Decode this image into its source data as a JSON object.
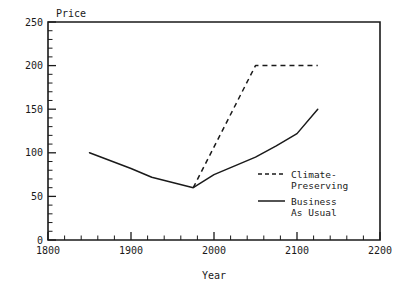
{
  "chart_data": {
    "type": "line",
    "title": "",
    "xlabel": "Year",
    "ylabel": "Price",
    "xlim": [
      1800,
      2200
    ],
    "ylim": [
      0,
      250
    ],
    "grid": false,
    "legend_position": "inside-right",
    "x_ticks": [
      1800,
      1900,
      2000,
      2100,
      2200
    ],
    "x_tick_labels": [
      "1800",
      "1900",
      "2000",
      "2100",
      "2200"
    ],
    "x_minor_step": 20,
    "y_ticks": [
      0,
      50,
      100,
      150,
      200,
      250
    ],
    "y_tick_labels": [
      "0",
      "50",
      "100",
      "150",
      "200",
      "250"
    ],
    "y_minor_step": 10,
    "series": [
      {
        "name": "Business As Usual",
        "style": "solid",
        "x": [
          1850,
          1900,
          1925,
          1950,
          1975,
          2000,
          2025,
          2050,
          2075,
          2100,
          2125
        ],
        "values": [
          100,
          82,
          72,
          66,
          60,
          75,
          85,
          95,
          108,
          122,
          150
        ]
      },
      {
        "name": "Climate-Preserving",
        "style": "dashed",
        "x": [
          1975,
          2050,
          2125
        ],
        "values": [
          60,
          200,
          200
        ]
      }
    ],
    "legend": [
      {
        "label_line1": "Climate-",
        "label_line2": "Preserving",
        "style": "dashed"
      },
      {
        "label_line1": "Business",
        "label_line2": "As Usual",
        "style": "solid"
      }
    ]
  },
  "axis": {
    "y_title": "Price",
    "x_title": "Year"
  }
}
